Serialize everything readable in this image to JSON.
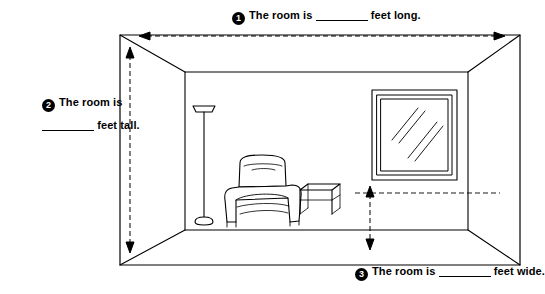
{
  "diagram": {
    "callouts": [
      {
        "number": "1",
        "name": "room-length-label",
        "text_before": "The room is",
        "blank_width_px": 52,
        "text_after": "feet long."
      },
      {
        "number": "2",
        "name": "room-height-label",
        "text_before": "The room is",
        "blank_width_px": 52,
        "text_after": "feet tall."
      },
      {
        "number": "3",
        "name": "room-width-label",
        "text_before": "The room is",
        "blank_width_px": 52,
        "text_after": "feet wide."
      }
    ],
    "scene": {
      "objects": [
        "floor-lamp",
        "recliner-armchair",
        "side-table",
        "window",
        "room-walls",
        "dimension-arrows"
      ],
      "line_color": "#000000",
      "fill_color": "#ffffff",
      "background_color": "#ffffff"
    }
  }
}
